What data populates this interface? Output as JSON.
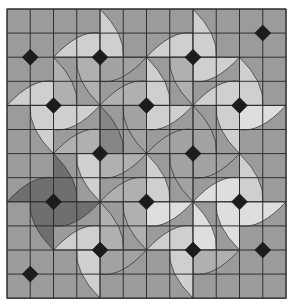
{
  "board": {
    "cols": 12,
    "rows": 12,
    "origin_x": 7,
    "origin_y": 9,
    "cell_w": 23.25,
    "cell_h": 24.1,
    "colors": {
      "background": "#9b9b9b",
      "grid_line": "#2e2e2e",
      "diamond": "#1c1c1c"
    },
    "shades": {
      "base": "#a2a2a2",
      "light": "#cfcfcf",
      "lighter": "#dedede",
      "medium": "#b0b0b0",
      "dark": "#6f6f6f",
      "darkmed": "#868686"
    },
    "pins": [
      {
        "col": 11,
        "row": 1,
        "blades": []
      },
      {
        "col": 1,
        "row": 2,
        "blades": []
      },
      {
        "col": 4,
        "row": 2,
        "blades": [
          "light",
          "light",
          "base",
          "medium"
        ]
      },
      {
        "col": 8,
        "row": 2,
        "blades": [
          "light",
          "light",
          "light",
          "medium"
        ]
      },
      {
        "col": 2,
        "row": 4,
        "blades": [
          "light",
          "medium",
          "light",
          "light"
        ]
      },
      {
        "col": 6,
        "row": 4,
        "blades": [
          "medium",
          "light",
          "light",
          "base"
        ]
      },
      {
        "col": 10,
        "row": 4,
        "blades": [
          "light",
          "light",
          "lighter",
          "light"
        ]
      },
      {
        "col": 4,
        "row": 6,
        "blades": [
          "medium",
          "darkmed",
          "medium",
          "light"
        ]
      },
      {
        "col": 8,
        "row": 6,
        "blades": [
          "base",
          "base",
          "base",
          "base"
        ]
      },
      {
        "col": 2,
        "row": 8,
        "blades": [
          "dark",
          "dark",
          "dark",
          "dark"
        ]
      },
      {
        "col": 6,
        "row": 8,
        "blades": [
          "medium",
          "light",
          "lighter",
          "medium"
        ]
      },
      {
        "col": 10,
        "row": 8,
        "blades": [
          "lighter",
          "light",
          "lighter",
          "lighter"
        ]
      },
      {
        "col": 4,
        "row": 10,
        "blades": [
          "light",
          "medium",
          "base",
          "light"
        ]
      },
      {
        "col": 8,
        "row": 10,
        "blades": [
          "light",
          "lighter",
          "medium",
          "light"
        ]
      },
      {
        "col": 11,
        "row": 10,
        "blades": []
      },
      {
        "col": 1,
        "row": 11,
        "blades": []
      }
    ]
  }
}
